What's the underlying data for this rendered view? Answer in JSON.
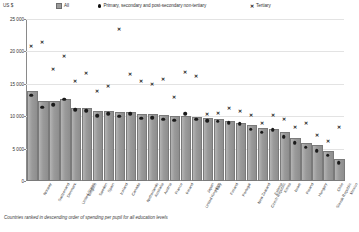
{
  "unit_label": "US $",
  "legend": {
    "all": "All",
    "primary": "Primary, secondary and post-secondary non-tertiary",
    "tertiary": "Tertiary"
  },
  "footnote": "Countries ranked in descending order of spending per pupil for all education levels",
  "chart_data": {
    "type": "bar",
    "title": "",
    "xlabel": "",
    "ylabel": "US $",
    "ylim": [
      0,
      25000
    ],
    "yticks": [
      0,
      5000,
      10000,
      15000,
      20000,
      25000
    ],
    "ytick_labels": [
      "0",
      "5 000",
      "10 000",
      "15 000",
      "20 000",
      "25 000"
    ],
    "grid": true,
    "legend_position": "top",
    "categories": [
      "Norway",
      "Switzerland",
      "Denmark",
      "United States",
      "Belgium",
      "Sweden",
      "Spain",
      "Iceland",
      "Canada",
      "Netherlands",
      "Australia",
      "Austria",
      "France",
      "Ireland",
      "United Kingdom",
      "Japan",
      "Italy",
      "Finland",
      "Portugal",
      "New Zealand",
      "Czech Republic",
      "Estonia",
      "Korea",
      "Israel",
      "Poland",
      "Hungary",
      "Slovak Republic",
      "Chile",
      "Mexico"
    ],
    "series": [
      {
        "name": "All",
        "marker": "bar",
        "values": [
          13600,
          12000,
          12000,
          12300,
          11000,
          10900,
          10500,
          10500,
          10400,
          10300,
          10000,
          10000,
          9900,
          9800,
          9700,
          9500,
          9400,
          9300,
          9000,
          8700,
          8300,
          7900,
          7700,
          7200,
          6300,
          5600,
          5200,
          4300,
          3100
        ]
      },
      {
        "name": "Primary, secondary and post-secondary non-tertiary",
        "marker": "dot",
        "values": [
          13200,
          11400,
          11800,
          12600,
          11000,
          10800,
          10100,
          10400,
          10000,
          10400,
          9700,
          9800,
          9500,
          9400,
          10400,
          9500,
          9300,
          9200,
          9000,
          8800,
          8000,
          7500,
          7900,
          6800,
          5900,
          5200,
          4700,
          4000,
          2800
        ]
      },
      {
        "name": "Tertiary",
        "marker": "x",
        "values": [
          20900,
          21400,
          17300,
          19300,
          15400,
          16700,
          13900,
          14700,
          23400,
          16500,
          15500,
          15000,
          15700,
          13000,
          16900,
          16200,
          10400,
          10500,
          11300,
          10800,
          10200,
          9000,
          10200,
          9600,
          8400,
          9000,
          7100,
          6100,
          8300
        ]
      }
    ]
  }
}
